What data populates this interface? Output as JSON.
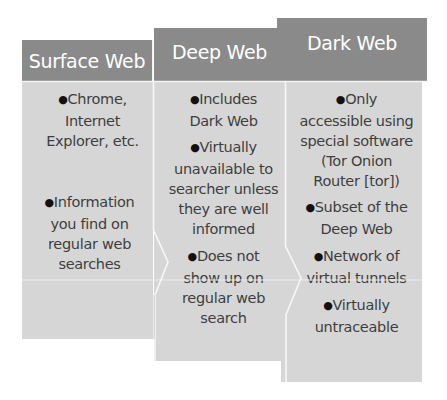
{
  "diagram": {
    "columns": [
      {
        "title": "Surface Web",
        "bullets": [
          "Chrome, Internet Explorer, etc.",
          "Information you find on regular web searches"
        ]
      },
      {
        "title": "Deep Web",
        "bullets": [
          "Includes Dark Web",
          "Virtually unavailable to searcher unless they are well informed",
          "Does not show up on regular web search"
        ]
      },
      {
        "title": "Dark Web",
        "bullets": [
          "Only accessible using special software (Tor Onion Router [tor])",
          "Subset of the Deep Web",
          "Network of virtual tunnels",
          "Virtually untraceable"
        ]
      }
    ],
    "bullet_glyph": "●",
    "colors": {
      "header": "#8a8a8a",
      "body": "#d6d6d6",
      "header_text": "#ffffff",
      "body_text": "#3e3e3e"
    }
  }
}
